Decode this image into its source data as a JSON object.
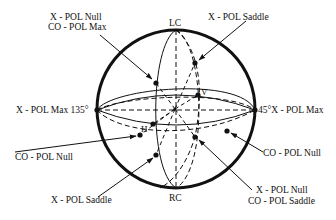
{
  "diagram": {
    "colors": {
      "ink": "#111111",
      "background": "#ffffff"
    },
    "sphere": {
      "cx": 176,
      "cy": 109,
      "r": 79
    },
    "pole_labels": {
      "top": "LC",
      "bottom": "RC",
      "vertical_point": "V",
      "horizontal_point": "H"
    },
    "annotations": [
      {
        "id": "xpol-null-copol-max",
        "lines": [
          "X - POL Null",
          "CO - POL Max"
        ]
      },
      {
        "id": "xpol-saddle-top",
        "lines": [
          "X - POL Saddle"
        ]
      },
      {
        "id": "xpol-max-135",
        "lines": [
          "X - POL Max 135°"
        ]
      },
      {
        "id": "xpol-max-45",
        "lines": [
          "45°X - POL Max"
        ]
      },
      {
        "id": "copol-null-left",
        "lines": [
          "CO - POL Null"
        ]
      },
      {
        "id": "xpol-saddle-bottom",
        "lines": [
          "X - POL Saddle"
        ]
      },
      {
        "id": "copol-null-right",
        "lines": [
          "CO - POL Null"
        ]
      },
      {
        "id": "xpol-null-copol-saddle",
        "lines": [
          "X - POL Null",
          "CO - POL Saddle"
        ]
      }
    ]
  }
}
